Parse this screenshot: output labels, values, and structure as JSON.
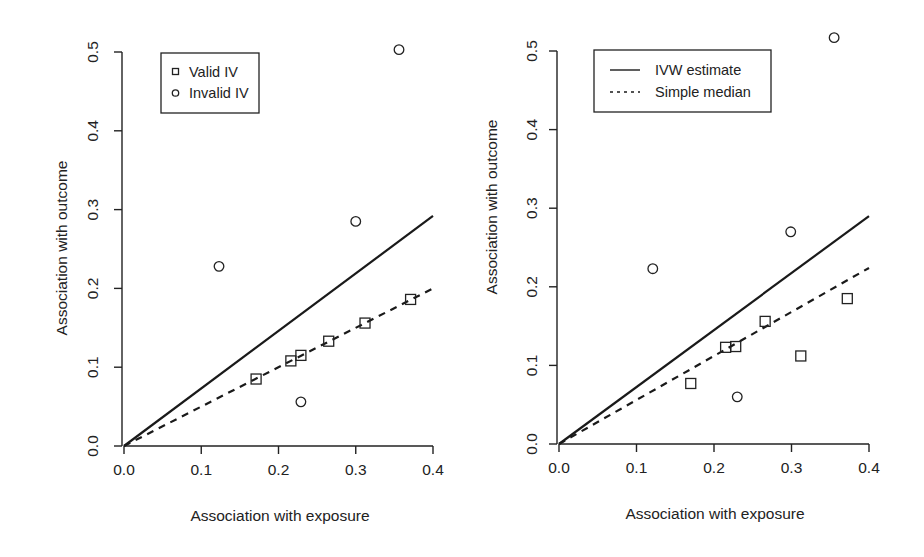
{
  "chart_data": [
    {
      "type": "scatter",
      "panel": "left",
      "title": "",
      "xlabel": "Association with exposure",
      "ylabel": "Association with outcome",
      "xlim": [
        0.0,
        0.4
      ],
      "ylim": [
        0.0,
        0.5
      ],
      "x_ticks": [
        "0.0",
        "0.1",
        "0.2",
        "0.3",
        "0.4"
      ],
      "y_ticks": [
        "0.0",
        "0.1",
        "0.2",
        "0.3",
        "0.4",
        "0.5"
      ],
      "grid": false,
      "legend": {
        "position": "top-left",
        "entries": [
          {
            "label": "Valid IV",
            "marker": "square"
          },
          {
            "label": "Invalid IV",
            "marker": "circle"
          }
        ]
      },
      "series": [
        {
          "name": "Valid IV",
          "marker": "square",
          "points": [
            {
              "x": 0.171,
              "y": 0.085
            },
            {
              "x": 0.216,
              "y": 0.108
            },
            {
              "x": 0.229,
              "y": 0.115
            },
            {
              "x": 0.265,
              "y": 0.133
            },
            {
              "x": 0.312,
              "y": 0.156
            },
            {
              "x": 0.371,
              "y": 0.186
            }
          ]
        },
        {
          "name": "Invalid IV",
          "marker": "circle",
          "points": [
            {
              "x": 0.123,
              "y": 0.228
            },
            {
              "x": 0.229,
              "y": 0.056
            },
            {
              "x": 0.3,
              "y": 0.285
            },
            {
              "x": 0.356,
              "y": 0.503
            }
          ]
        }
      ],
      "lines": [
        {
          "name": "IVW estimate",
          "style": "solid",
          "slope": 0.73,
          "intercept": 0.0
        },
        {
          "name": "Simple median",
          "style": "dashed",
          "slope": 0.5,
          "intercept": 0.0
        }
      ]
    },
    {
      "type": "scatter",
      "panel": "right",
      "title": "",
      "xlabel": "Association with exposure",
      "ylabel": "Association with outcome",
      "xlim": [
        0.0,
        0.4
      ],
      "ylim": [
        0.0,
        0.5
      ],
      "x_ticks": [
        "0.0",
        "0.1",
        "0.2",
        "0.3",
        "0.4"
      ],
      "y_ticks": [
        "0.0",
        "0.1",
        "0.2",
        "0.3",
        "0.4",
        "0.5"
      ],
      "grid": false,
      "legend": {
        "position": "top-left",
        "entries": [
          {
            "label": "IVW estimate",
            "line": "solid"
          },
          {
            "label": "Simple median",
            "line": "dashed"
          }
        ]
      },
      "series": [
        {
          "name": "Valid IV",
          "marker": "square",
          "points": [
            {
              "x": 0.17,
              "y": 0.077
            },
            {
              "x": 0.215,
              "y": 0.123
            },
            {
              "x": 0.228,
              "y": 0.124
            },
            {
              "x": 0.266,
              "y": 0.156
            },
            {
              "x": 0.312,
              "y": 0.112
            },
            {
              "x": 0.372,
              "y": 0.185
            }
          ]
        },
        {
          "name": "Invalid IV",
          "marker": "circle",
          "points": [
            {
              "x": 0.121,
              "y": 0.223
            },
            {
              "x": 0.23,
              "y": 0.06
            },
            {
              "x": 0.299,
              "y": 0.27
            },
            {
              "x": 0.355,
              "y": 0.517
            }
          ]
        }
      ],
      "lines": [
        {
          "name": "IVW estimate",
          "style": "solid",
          "slope": 0.725,
          "intercept": 0.0
        },
        {
          "name": "Simple median",
          "style": "dashed",
          "slope": 0.56,
          "intercept": 0.0
        }
      ]
    }
  ],
  "panels": {
    "left": {
      "xlabel": "Association with exposure",
      "ylabel": "Association with outcome",
      "legend": [
        "Valid IV",
        "Invalid IV"
      ]
    },
    "right": {
      "xlabel": "Association with exposure",
      "ylabel": "Association with outcome",
      "legend": [
        "IVW estimate",
        "Simple median"
      ]
    }
  }
}
